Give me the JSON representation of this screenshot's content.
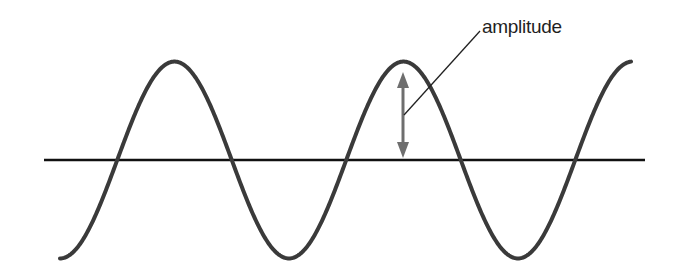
{
  "diagram": {
    "type": "sine-wave-amplitude",
    "labels": {
      "amplitude": "amplitude"
    },
    "colors": {
      "wave": "#3a3a3a",
      "axis": "#111111",
      "arrow": "#6e6e6e",
      "leader": "#222222",
      "background": "#ffffff"
    },
    "wave": {
      "x_start": 60,
      "x_end": 631,
      "baseline_y": 160,
      "amplitude_px": 92,
      "period_px": 229,
      "start_phase": "trough"
    },
    "axis": {
      "x1": 44,
      "x2": 645,
      "y": 160
    }
  }
}
